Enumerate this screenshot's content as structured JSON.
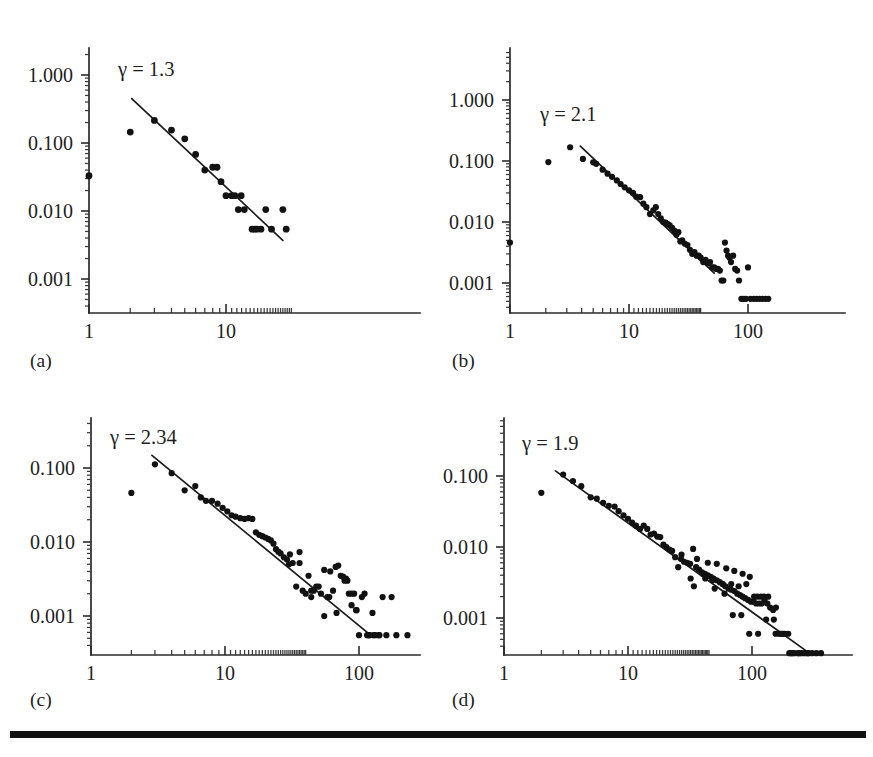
{
  "figure": {
    "panel_count": 4,
    "background_color": "#ffffff",
    "ink_color": "#121212",
    "bottom_rule": {
      "name": "horizontal-rule",
      "visible": true
    }
  },
  "chart_data": [
    {
      "type": "scatter",
      "panel": "(a)",
      "title": "",
      "annotation": "γ = 1.3",
      "gamma": 1.3,
      "xlabel": "",
      "ylabel": "",
      "xscale": "log",
      "yscale": "log",
      "xlim": [
        1,
        60
      ],
      "ylim": [
        0.0004,
        2.2
      ],
      "xticks": [
        1,
        10
      ],
      "xtick_labels": [
        "1",
        "10"
      ],
      "yticks": [
        1.0,
        0.1,
        0.01,
        0.001
      ],
      "ytick_labels": [
        "1.000",
        "0.100",
        "0.010",
        "0.001"
      ],
      "grid": false,
      "legend": "none",
      "fit": {
        "x_start": 2.05,
        "y_start": 0.45,
        "x_end": 26.0,
        "y_end": 0.0037
      },
      "x": [
        1.0,
        2.0,
        3.0,
        4.0,
        5.0,
        6.0,
        7.0,
        8.0,
        8.6,
        9.2,
        10.0,
        11.0,
        11.6,
        12.3,
        12.9,
        13.6,
        15.5,
        16.2,
        16.8,
        18.0,
        19.5,
        21.5,
        26.0,
        27.5
      ],
      "y": [
        0.033,
        0.145,
        0.215,
        0.155,
        0.115,
        0.068,
        0.04,
        0.044,
        0.044,
        0.027,
        0.0168,
        0.0168,
        0.0168,
        0.0105,
        0.0168,
        0.0105,
        0.0054,
        0.0054,
        0.0054,
        0.0054,
        0.0105,
        0.0054,
        0.0105,
        0.0054
      ]
    },
    {
      "type": "scatter",
      "panel": "(b)",
      "title": "",
      "annotation": "γ = 2.1",
      "gamma": 2.1,
      "xlabel": "",
      "ylabel": "",
      "xscale": "log",
      "yscale": "log",
      "xlim": [
        1,
        400
      ],
      "ylim": [
        0.00035,
        2.6
      ],
      "xticks": [
        1,
        10,
        100
      ],
      "xtick_labels": [
        "1",
        "10",
        "100"
      ],
      "yticks": [
        1.0,
        0.1,
        0.01,
        0.001
      ],
      "ytick_labels": [
        "1.000",
        "0.100",
        "0.010",
        "0.001"
      ],
      "grid": false,
      "legend": "none",
      "fit": {
        "x_start": 3.9,
        "y_start": 0.175,
        "x_end": 52.0,
        "y_end": 0.00145
      },
      "x": [
        1.0,
        2.1,
        3.2,
        4.1,
        5.0,
        5.3,
        6.0,
        6.6,
        7.2,
        7.9,
        8.5,
        9.2,
        10.0,
        10.8,
        11.5,
        12.4,
        13.2,
        14.0,
        15.0,
        16.0,
        16.8,
        17.6,
        18.5,
        19.4,
        20.3,
        21.2,
        22.0,
        23.0,
        24.0,
        25.0,
        26.0,
        27.0,
        28.0,
        29.5,
        31.0,
        32.5,
        34.0,
        35.5,
        37.0,
        38.5,
        40.0,
        42.0,
        44.0,
        46.0,
        48.0,
        50.0,
        52.0,
        54.0,
        56.0,
        58.0,
        60.0,
        62.0,
        64.0,
        66.0,
        68.0,
        70.0,
        72.0,
        75.0,
        78.0,
        81.0,
        84.0,
        88.0,
        92.0,
        96.0,
        100.0,
        105.0,
        112.0,
        118.0,
        125.0,
        132.0,
        140.0,
        148.0
      ],
      "y": [
        0.0046,
        0.096,
        0.168,
        0.108,
        0.095,
        0.09,
        0.072,
        0.062,
        0.055,
        0.048,
        0.042,
        0.037,
        0.033,
        0.03,
        0.026,
        0.0255,
        0.02,
        0.0175,
        0.0135,
        0.0155,
        0.0175,
        0.0135,
        0.0115,
        0.01,
        0.0098,
        0.0092,
        0.0088,
        0.008,
        0.0072,
        0.0062,
        0.0068,
        0.0048,
        0.005,
        0.0044,
        0.0042,
        0.0035,
        0.003,
        0.0032,
        0.0028,
        0.0028,
        0.0026,
        0.0022,
        0.0024,
        0.0021,
        0.0022,
        0.0018,
        0.0018,
        0.0017,
        0.0017,
        0.0016,
        0.0011,
        0.0011,
        0.0046,
        0.0034,
        0.0028,
        0.0026,
        0.0022,
        0.0028,
        0.0017,
        0.0016,
        0.0011,
        0.00055,
        0.00055,
        0.00055,
        0.0018,
        0.00055,
        0.00055,
        0.00055,
        0.00055,
        0.00055,
        0.00055,
        0.00055
      ]
    },
    {
      "type": "scatter",
      "panel": "(c)",
      "title": "",
      "annotation": "γ = 2.34",
      "gamma": 2.34,
      "xlabel": "",
      "ylabel": "",
      "xscale": "log",
      "yscale": "log",
      "xlim": [
        1,
        500
      ],
      "ylim": [
        0.00035,
        0.3
      ],
      "xticks": [
        1,
        10,
        100
      ],
      "xtick_labels": [
        "1",
        "10",
        "100"
      ],
      "yticks": [
        0.1,
        0.01,
        0.001
      ],
      "ytick_labels": [
        "0.100",
        "0.010",
        "0.001"
      ],
      "grid": false,
      "legend": "none",
      "fit": {
        "x_start": 2.85,
        "y_start": 0.148,
        "x_end": 122.0,
        "y_end": 0.00055
      },
      "x": [
        2.0,
        3.0,
        4.0,
        5.0,
        6.0,
        6.6,
        7.2,
        8.0,
        8.8,
        9.6,
        10.4,
        11.2,
        12.0,
        13.0,
        14.0,
        15.0,
        16.0,
        17.0,
        18.0,
        19.0,
        20.0,
        21.0,
        22.0,
        23.0,
        24.0,
        25.0,
        26.0,
        27.5,
        29.0,
        30.5,
        32.0,
        34.0,
        36.0,
        38.0,
        40.0,
        42.0,
        44.0,
        46.0,
        48.0,
        50.0,
        52.0,
        55.0,
        58.0,
        61.0,
        64.0,
        67.0,
        70.0,
        73.0,
        76.0,
        80.0,
        84.0,
        88.0,
        92.0,
        96.0,
        100.0,
        105.0,
        110.0,
        115.0,
        120.0,
        126.0,
        132.0,
        140.0,
        150.0,
        160.0,
        175.0,
        190.0,
        230.0,
        60.0,
        36.0,
        30.0,
        44.0,
        78.0,
        82.0,
        95.0,
        118.0,
        128.0,
        142.0,
        55.0,
        68.0,
        88.0
      ],
      "y": [
        0.046,
        0.112,
        0.085,
        0.05,
        0.057,
        0.04,
        0.036,
        0.036,
        0.033,
        0.029,
        0.026,
        0.023,
        0.022,
        0.021,
        0.0205,
        0.021,
        0.0205,
        0.0135,
        0.0125,
        0.012,
        0.0115,
        0.011,
        0.0105,
        0.0095,
        0.008,
        0.0074,
        0.007,
        0.0062,
        0.0058,
        0.0068,
        0.0052,
        0.0025,
        0.0052,
        0.0022,
        0.002,
        0.0035,
        0.0022,
        0.0022,
        0.0025,
        0.0025,
        0.002,
        0.0042,
        0.0018,
        0.004,
        0.0022,
        0.0046,
        0.0048,
        0.0035,
        0.0034,
        0.0032,
        0.002,
        0.002,
        0.002,
        0.0012,
        0.00055,
        0.0018,
        0.002,
        0.00055,
        0.00055,
        0.0011,
        0.00055,
        0.00055,
        0.0018,
        0.00055,
        0.0018,
        0.00055,
        0.00055,
        0.0018,
        0.0073,
        0.005,
        0.0018,
        0.003,
        0.003,
        0.0012,
        0.00055,
        0.00055,
        0.00055,
        0.001,
        0.0011,
        0.0014
      ]
    },
    {
      "type": "scatter",
      "panel": "(d)",
      "title": "",
      "annotation": "γ = 1.9",
      "gamma": 1.9,
      "xlabel": "",
      "ylabel": "",
      "xscale": "log",
      "yscale": "log",
      "xlim": [
        1,
        600
      ],
      "ylim": [
        0.00026,
        0.26
      ],
      "xticks": [
        1,
        10,
        100
      ],
      "xtick_labels": [
        "1",
        "10",
        "100"
      ],
      "yticks": [
        0.1,
        0.01,
        0.001
      ],
      "ytick_labels": [
        "0.100",
        "0.010",
        "0.001"
      ],
      "grid": false,
      "legend": "none",
      "fit": {
        "x_start": 2.6,
        "y_start": 0.118,
        "x_end": 290.0,
        "y_end": 0.00032
      },
      "x": [
        2.0,
        3.0,
        3.6,
        4.2,
        5.0,
        5.6,
        6.3,
        7.0,
        7.8,
        8.4,
        9.2,
        10.0,
        10.8,
        11.6,
        12.5,
        13.4,
        14.3,
        15.2,
        16.2,
        17.2,
        18.2,
        19.3,
        20.4,
        21.5,
        22.7,
        24.0,
        25.4,
        26.8,
        28.3,
        30.0,
        31.7,
        33.5,
        35.4,
        37.4,
        39.5,
        41.7,
        44.0,
        46.5,
        49.0,
        52.0,
        55.0,
        58.0,
        61.0,
        64.5,
        68.0,
        72.0,
        76.0,
        80.0,
        84.0,
        88.0,
        93.0,
        98.0,
        103.0,
        108.0,
        114.0,
        120.0,
        126.0,
        133.0,
        140.0,
        148.0,
        156.0,
        165.0,
        175.0,
        185.0,
        196.0,
        208.0,
        220.0,
        235.0,
        250.0,
        265.0,
        285.0,
        305.0,
        330.0,
        360.0,
        36.0,
        44.0,
        52.0,
        62.0,
        72.0,
        84.0,
        96.0,
        110.0,
        125.0,
        32.0,
        40.0,
        48.0,
        58.0,
        68.0,
        78.0,
        90.0,
        104.0,
        118.0,
        135.0,
        155.0,
        180.0,
        210.0,
        27.0,
        34.0,
        42.0,
        50.0,
        60.0,
        70.0,
        82.0,
        95.0,
        112.0,
        130.0,
        150.0,
        170.0,
        200.0,
        240.0,
        280.0
      ],
      "y": [
        0.058,
        0.105,
        0.085,
        0.072,
        0.05,
        0.048,
        0.042,
        0.038,
        0.037,
        0.032,
        0.028,
        0.025,
        0.022,
        0.02,
        0.018,
        0.02,
        0.018,
        0.015,
        0.0155,
        0.014,
        0.0138,
        0.0108,
        0.01,
        0.0092,
        0.0088,
        0.0072,
        0.0052,
        0.0068,
        0.0062,
        0.006,
        0.0058,
        0.0094,
        0.0052,
        0.0048,
        0.0044,
        0.0042,
        0.004,
        0.0038,
        0.0036,
        0.0034,
        0.0032,
        0.003,
        0.0028,
        0.0026,
        0.0025,
        0.0024,
        0.0022,
        0.0021,
        0.002,
        0.0019,
        0.0018,
        0.0017,
        0.0017,
        0.0016,
        0.0016,
        0.0016,
        0.0018,
        0.0016,
        0.0014,
        0.0013,
        0.0014,
        0.0006,
        0.0006,
        0.0006,
        0.0006,
        0.00032,
        0.00032,
        0.00032,
        0.00032,
        0.00032,
        0.00032,
        0.00032,
        0.00032,
        0.00032,
        0.0068,
        0.006,
        0.0058,
        0.005,
        0.0046,
        0.0042,
        0.0038,
        0.002,
        0.002,
        0.0036,
        0.0042,
        0.0034,
        0.003,
        0.003,
        0.0028,
        0.003,
        0.002,
        0.002,
        0.002,
        0.0006,
        0.0006,
        0.00032,
        0.0078,
        0.0028,
        0.0036,
        0.0026,
        0.0022,
        0.0011,
        0.0011,
        0.0006,
        0.0006,
        0.00095,
        0.00095,
        0.0006,
        0.00032,
        0.00032,
        0.00032
      ]
    }
  ]
}
